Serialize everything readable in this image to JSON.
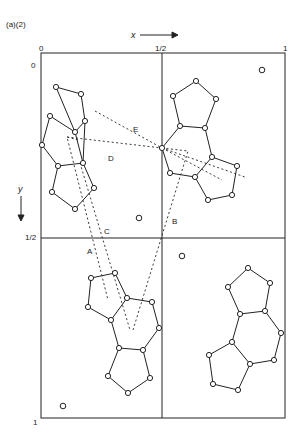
{
  "figure": {
    "panel_label": "(a)(2)",
    "x_axis": {
      "label": "x",
      "ticks": [
        "0",
        "1/2",
        "1"
      ]
    },
    "y_axis": {
      "label": "y",
      "ticks": [
        "0",
        "1/2",
        "1"
      ]
    },
    "contact_labels": [
      "A",
      "B",
      "C",
      "D",
      "E"
    ],
    "colors": {
      "line": "#222222",
      "background": "#ffffff"
    },
    "molecules": [
      {
        "name": "molecule-upper-left",
        "atoms": [
          [
            56,
            87
          ],
          [
            81,
            94
          ],
          [
            85,
            121
          ],
          [
            75,
            132
          ],
          [
            50,
            116
          ],
          [
            42,
            145
          ],
          [
            58,
            166
          ],
          [
            83,
            163
          ],
          [
            94,
            188
          ],
          [
            75,
            209
          ],
          [
            52,
            192
          ]
        ],
        "bonds": [
          [
            0,
            1
          ],
          [
            1,
            2
          ],
          [
            2,
            3
          ],
          [
            3,
            0
          ],
          [
            3,
            4
          ],
          [
            4,
            5
          ],
          [
            5,
            6
          ],
          [
            6,
            7
          ],
          [
            7,
            3
          ],
          [
            2,
            7
          ],
          [
            7,
            8
          ],
          [
            8,
            9
          ],
          [
            9,
            10
          ],
          [
            10,
            6
          ]
        ]
      },
      {
        "name": "molecule-upper-right",
        "atoms": [
          [
            196,
            81
          ],
          [
            216,
            99
          ],
          [
            205,
            128
          ],
          [
            180,
            126
          ],
          [
            173,
            96
          ],
          [
            162,
            148
          ],
          [
            170,
            173
          ],
          [
            195,
            177
          ],
          [
            212,
            157
          ],
          [
            237,
            166
          ],
          [
            232,
            195
          ],
          [
            208,
            200
          ]
        ],
        "bonds": [
          [
            0,
            1
          ],
          [
            1,
            2
          ],
          [
            2,
            3
          ],
          [
            3,
            4
          ],
          [
            4,
            0
          ],
          [
            3,
            5
          ],
          [
            5,
            6
          ],
          [
            6,
            7
          ],
          [
            7,
            8
          ],
          [
            8,
            2
          ],
          [
            8,
            9
          ],
          [
            9,
            10
          ],
          [
            10,
            11
          ],
          [
            11,
            7
          ]
        ]
      },
      {
        "name": "molecule-lower-left",
        "atoms": [
          [
            91,
            278
          ],
          [
            115,
            273
          ],
          [
            127,
            298
          ],
          [
            111,
            320
          ],
          [
            88,
            307
          ],
          [
            152,
            302
          ],
          [
            159,
            328
          ],
          [
            143,
            350
          ],
          [
            119,
            348
          ],
          [
            108,
            376
          ],
          [
            128,
            393
          ],
          [
            150,
            378
          ]
        ],
        "bonds": [
          [
            0,
            1
          ],
          [
            1,
            2
          ],
          [
            2,
            3
          ],
          [
            3,
            4
          ],
          [
            4,
            0
          ],
          [
            2,
            5
          ],
          [
            5,
            6
          ],
          [
            6,
            7
          ],
          [
            7,
            8
          ],
          [
            8,
            3
          ],
          [
            8,
            9
          ],
          [
            9,
            10
          ],
          [
            10,
            11
          ],
          [
            11,
            7
          ]
        ]
      },
      {
        "name": "molecule-lower-right",
        "atoms": [
          [
            248,
            268
          ],
          [
            270,
            283
          ],
          [
            265,
            311
          ],
          [
            240,
            314
          ],
          [
            228,
            287
          ],
          [
            281,
            333
          ],
          [
            274,
            360
          ],
          [
            250,
            364
          ],
          [
            232,
            342
          ],
          [
            209,
            355
          ],
          [
            213,
            384
          ],
          [
            238,
            390
          ]
        ],
        "bonds": [
          [
            0,
            1
          ],
          [
            1,
            2
          ],
          [
            2,
            3
          ],
          [
            3,
            4
          ],
          [
            4,
            0
          ],
          [
            2,
            5
          ],
          [
            5,
            6
          ],
          [
            6,
            7
          ],
          [
            7,
            8
          ],
          [
            8,
            3
          ],
          [
            8,
            9
          ],
          [
            9,
            10
          ],
          [
            10,
            11
          ],
          [
            11,
            7
          ]
        ]
      }
    ],
    "isolated_atoms": [
      [
        262,
        70
      ],
      [
        139,
        218
      ],
      [
        182,
        256
      ],
      [
        63,
        406
      ]
    ],
    "contacts": [
      {
        "label": "A",
        "path": [
          [
            78,
            140
          ],
          [
            67,
            137
          ],
          [
            108,
            300
          ]
        ],
        "label_pos": [
          87,
          248
        ]
      },
      {
        "label": "C",
        "path": [
          [
            80,
            163
          ],
          [
            130,
            330
          ]
        ],
        "label_pos": [
          104,
          228
        ]
      },
      {
        "label": "B",
        "path": [
          [
            162,
            148
          ],
          [
            188,
            151
          ],
          [
            133,
            330
          ]
        ],
        "label_pos": [
          172,
          218
        ]
      },
      {
        "label": "D",
        "path": [
          [
            67,
            137
          ],
          [
            162,
            148
          ]
        ],
        "label_pos": [
          108,
          155
        ]
      },
      {
        "label": "E",
        "path": [
          [
            95,
            111
          ],
          [
            162,
            148
          ],
          [
            222,
            180
          ]
        ],
        "label_pos": [
          133,
          126
        ]
      },
      {
        "label": "",
        "path": [
          [
            162,
            148
          ],
          [
            245,
            177
          ]
        ],
        "label_pos": null
      }
    ]
  }
}
